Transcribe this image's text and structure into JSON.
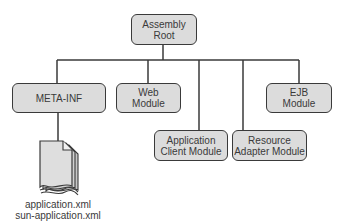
{
  "diagram": {
    "root": {
      "line1": "Assembly",
      "line2": "Root"
    },
    "children": [
      {
        "id": "meta-inf",
        "line1": "META-INF",
        "line2": ""
      },
      {
        "id": "web",
        "line1": "Web",
        "line2": "Module"
      },
      {
        "id": "app-client",
        "line1": "Application",
        "line2": "Client Module"
      },
      {
        "id": "resource-adapter",
        "line1": "Resource",
        "line2": "Adapter Module"
      },
      {
        "id": "ejb",
        "line1": "EJB",
        "line2": "Module"
      }
    ],
    "document": {
      "icon": "xml-document-icon",
      "files": [
        "application.xml",
        "sun-application.xml"
      ]
    },
    "colors": {
      "box_fill": "#dcdcdc",
      "stroke": "#3a3a3a",
      "background": "#ffffff"
    }
  }
}
